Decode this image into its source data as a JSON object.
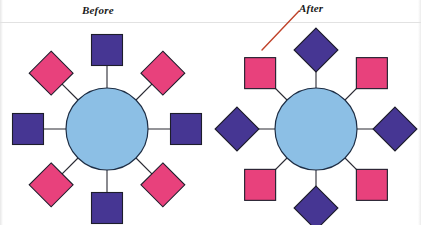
{
  "figure": {
    "type": "node-hub-diagram",
    "panel_count": 2,
    "background_color": "#ffffff",
    "divider_line_color": "#e2e2e2"
  },
  "captions": {
    "before": "Before",
    "after": "After"
  },
  "annotation": {
    "leader_line_color": "#c0432a",
    "leader_line_from": [
      262,
      50
    ],
    "leader_line_to": [
      299,
      11
    ],
    "points_at": "nw-node-of-after-panel"
  },
  "colors": {
    "purple": "#463693",
    "pink": "#e8417c",
    "hub_blue": "#8cbfe5",
    "outline": "#1d1d2b",
    "spoke": "#2a2a33"
  },
  "panels": [
    {
      "id": "before",
      "label": "Before",
      "hub": {
        "label": "",
        "shape": "circle",
        "color": "#8cbfe5",
        "center": [
          107,
          129
        ],
        "radius": 41
      },
      "node_radius": 79,
      "node_size": 31,
      "nodes": [
        {
          "position": "n",
          "angle": 90,
          "shape": "square",
          "color": "#463693"
        },
        {
          "position": "ne",
          "angle": 45,
          "shape": "diamond",
          "color": "#e8417c"
        },
        {
          "position": "e",
          "angle": 0,
          "shape": "square",
          "color": "#463693"
        },
        {
          "position": "se",
          "angle": -45,
          "shape": "diamond",
          "color": "#e8417c"
        },
        {
          "position": "s",
          "angle": -90,
          "shape": "square",
          "color": "#463693"
        },
        {
          "position": "sw",
          "angle": 225,
          "shape": "diamond",
          "color": "#e8417c"
        },
        {
          "position": "w",
          "angle": 180,
          "shape": "square",
          "color": "#463693"
        },
        {
          "position": "nw",
          "angle": 135,
          "shape": "diamond",
          "color": "#e8417c"
        }
      ]
    },
    {
      "id": "after",
      "label": "After",
      "hub": {
        "label": "",
        "shape": "circle",
        "color": "#8cbfe5",
        "center": [
          316,
          129
        ],
        "radius": 41
      },
      "node_radius": 79,
      "node_size": 31,
      "nodes": [
        {
          "position": "n",
          "angle": 90,
          "shape": "diamond",
          "color": "#463693"
        },
        {
          "position": "ne",
          "angle": 45,
          "shape": "square",
          "color": "#e8417c"
        },
        {
          "position": "e",
          "angle": 0,
          "shape": "diamond",
          "color": "#463693"
        },
        {
          "position": "se",
          "angle": -45,
          "shape": "square",
          "color": "#e8417c"
        },
        {
          "position": "s",
          "angle": -90,
          "shape": "diamond",
          "color": "#463693"
        },
        {
          "position": "sw",
          "angle": 225,
          "shape": "square",
          "color": "#e8417c"
        },
        {
          "position": "w",
          "angle": 180,
          "shape": "diamond",
          "color": "#463693"
        },
        {
          "position": "nw",
          "angle": 135,
          "shape": "square",
          "color": "#e8417c"
        }
      ]
    }
  ]
}
